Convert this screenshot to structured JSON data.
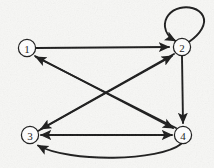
{
  "figure": {
    "kind": "directed-graph",
    "width": 214,
    "height": 168,
    "background_color": "#f7f7f5",
    "stroke_color": "#1a1a1a",
    "node_fill_color": "#ffffff",
    "label_color": "#1a1a1a"
  },
  "nodes": [
    {
      "id": "1",
      "label": "1",
      "cx": 27,
      "cy": 48,
      "r": 9
    },
    {
      "id": "2",
      "label": "2",
      "cx": 182,
      "cy": 47,
      "r": 9
    },
    {
      "id": "3",
      "label": "3",
      "cx": 30,
      "cy": 135,
      "r": 9
    },
    {
      "id": "4",
      "label": "4",
      "cx": 183,
      "cy": 135,
      "r": 9
    }
  ],
  "edges": [
    {
      "id": "e1-2",
      "from": "1",
      "to": "2",
      "shape": "straight",
      "directed": true,
      "description": "1 to 2 horizontal"
    },
    {
      "id": "e2-2",
      "from": "2",
      "to": "2",
      "shape": "self-loop",
      "directed": true,
      "description": "2 self loop above"
    },
    {
      "id": "e2-4",
      "from": "2",
      "to": "4",
      "shape": "straight",
      "directed": true,
      "description": "2 down to 4 vertical"
    },
    {
      "id": "e2-3",
      "from": "2",
      "to": "3",
      "shape": "straight",
      "directed": true,
      "description": "2 diagonal down-left to 3"
    },
    {
      "id": "e1-4",
      "from": "1",
      "to": "4",
      "shape": "straight",
      "directed": true,
      "description": "1 diagonal down-right to 4"
    },
    {
      "id": "e3-2",
      "from": "3",
      "to": "2",
      "shape": "straight",
      "directed": true,
      "description": "3 diagonal up-right to 2"
    },
    {
      "id": "e4-1",
      "from": "4",
      "to": "1",
      "shape": "straight",
      "directed": true,
      "description": "4 diagonal up-left to 1"
    },
    {
      "id": "e3-4-bi",
      "from": "3",
      "to": "4",
      "shape": "straight",
      "directed": true,
      "bidirectional": true,
      "description": "3 and 4 horizontal both arrowheads"
    },
    {
      "id": "e4-3-curve",
      "from": "4",
      "to": "3",
      "shape": "curved",
      "directed": true,
      "description": "4 curved below back to 3"
    }
  ],
  "geometry": {
    "edge_1_2": {
      "x1": 36,
      "y1": 48,
      "x2": 171,
      "y2": 47
    },
    "edge_2_4": {
      "x1": 182,
      "y1": 56,
      "x2": 183,
      "y2": 125
    },
    "edge_2_3": {
      "x1": 174,
      "y1": 54,
      "x2": 39,
      "y2": 130
    },
    "edge_1_4": {
      "x1": 35,
      "y1": 55,
      "x2": 175,
      "y2": 129
    },
    "edge_3_2": {
      "x1": 38,
      "y1": 131,
      "x2": 174,
      "y2": 55
    },
    "edge_4_1": {
      "x1": 176,
      "y1": 129,
      "x2": 34,
      "y2": 55
    },
    "edge_3_4_bi": {
      "x1": 39,
      "y1": 135,
      "x2": 174,
      "y2": 135
    },
    "edge_4_3_curve": {
      "x1": 180,
      "y1": 144,
      "cx": 107,
      "cy": 167,
      "x2": 36,
      "y2": 143
    },
    "self_loop_2": {
      "start_x": 189,
      "start_y": 41,
      "end_x": 176,
      "end_y": 41,
      "top_y": 10,
      "left_x": 163,
      "right_x": 207
    }
  }
}
